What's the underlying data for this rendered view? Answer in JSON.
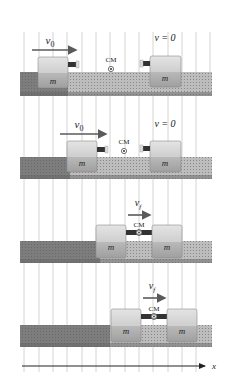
{
  "figure": {
    "axis_label": "x",
    "mass_label": "m",
    "cm_label": "CM",
    "colors": {
      "grid": "#c9c9c9",
      "track_dark": "#7a7a7a",
      "track_light": "#c2c2c2",
      "block_top": "#dcdcdc",
      "block_bottom": "#a9a9a9",
      "arrow": "#5a5a5a",
      "axis": "#222222",
      "text": "#222222"
    }
  },
  "panels": [
    {
      "id": "before",
      "left_velocity_label": "v0",
      "right_velocity_label": "v = 0",
      "track_y": 72,
      "left_block_x": 38,
      "right_block_x": 150,
      "cm_x": 107,
      "left_arrow": {
        "x1": 32,
        "x2": 76,
        "y": 50
      },
      "right_label_x": 165,
      "shade_split": 68
    },
    {
      "id": "approaching",
      "left_velocity_label": "v0",
      "right_velocity_label": "v = 0",
      "track_y": 157,
      "left_block_x": 67,
      "right_block_x": 150,
      "cm_x": 122,
      "left_arrow": {
        "x1": 60,
        "x2": 106,
        "y": 134
      },
      "right_label_x": 165,
      "shade_split": 97
    },
    {
      "id": "stuck",
      "velocity_label": "vf",
      "track_y": 241,
      "left_block_x": 96,
      "right_block_x": 151,
      "cm_x": 139,
      "arrow": {
        "x1": 128,
        "x2": 150,
        "y": 215
      },
      "shade_split": 125
    },
    {
      "id": "moving-together",
      "velocity_label": "vf",
      "track_y": 325,
      "left_block_x": 110,
      "right_block_x": 166,
      "cm_x": 153,
      "arrow": {
        "x1": 142,
        "x2": 164,
        "y": 298
      },
      "shade_split": 140
    }
  ]
}
